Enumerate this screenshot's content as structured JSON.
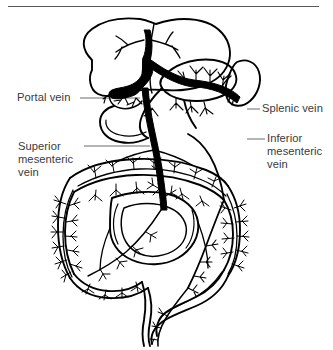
{
  "figure": {
    "background_color": "#ffffff",
    "line_color": "#000000",
    "leader_color": "#6b6b70",
    "label_color": "#3a3a3c",
    "rule_color": "#59595c",
    "width": 333,
    "height": 350
  },
  "labels": {
    "portal_vein": "Portal vein",
    "splenic_vein": "Splenic vein",
    "superior_mesenteric_vein_line1": "Superior",
    "superior_mesenteric_vein_line2": "mesenteric",
    "superior_mesenteric_vein_line3": "vein",
    "inferior_mesenteric_vein_line1": "Inferior",
    "inferior_mesenteric_vein_line2": "mesenteric",
    "inferior_mesenteric_vein_line3": "vein"
  },
  "structures": [
    "liver",
    "falciform-ligament",
    "gallbladder",
    "portal-vein-trunk",
    "splenic-vein",
    "spleen",
    "pancreas",
    "superior-mesenteric-vein",
    "inferior-mesenteric-vein",
    "transverse-colon",
    "ascending-colon",
    "descending-colon",
    "sigmoid-colon",
    "rectum",
    "small-intestine",
    "mesenteric-arcades"
  ]
}
